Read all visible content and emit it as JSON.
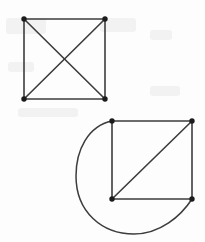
{
  "figure": {
    "background_color": "#fdfdfd",
    "edge_color": "#3c3c3c",
    "vertex_color": "#1c1c1c",
    "width": 205,
    "height": 242
  },
  "graphs": [
    {
      "id": "top-graph",
      "name": "complete-graph-k4",
      "description": "Square with both diagonals drawn (K4)",
      "vertices": [
        {
          "name": "top-left",
          "x": 24,
          "y": 19
        },
        {
          "name": "top-right",
          "x": 105,
          "y": 19
        },
        {
          "name": "bottom-left",
          "x": 24,
          "y": 99
        },
        {
          "name": "bottom-right",
          "x": 105,
          "y": 99
        }
      ],
      "edges": [
        {
          "name": "top-side",
          "type": "line",
          "x1": 24,
          "y1": 19,
          "x2": 105,
          "y2": 19
        },
        {
          "name": "right-side",
          "type": "line",
          "x1": 105,
          "y1": 19,
          "x2": 105,
          "y2": 99
        },
        {
          "name": "bottom-side",
          "type": "line",
          "x1": 24,
          "y1": 99,
          "x2": 105,
          "y2": 99
        },
        {
          "name": "left-side",
          "type": "line",
          "x1": 24,
          "y1": 19,
          "x2": 24,
          "y2": 99
        },
        {
          "name": "diagonal-tl-br",
          "type": "line",
          "x1": 24,
          "y1": 19,
          "x2": 105,
          "y2": 99
        },
        {
          "name": "diagonal-tr-bl",
          "type": "line",
          "x1": 105,
          "y1": 19,
          "x2": 24,
          "y2": 99
        }
      ],
      "vertex_count": 4,
      "edge_count": 6
    },
    {
      "id": "bottom-graph",
      "name": "square-with-diagonal-and-loop-edge",
      "description": "Square with one diagonal plus a long curved edge sweeping left and below",
      "vertices": [
        {
          "name": "top-left",
          "x": 112,
          "y": 121
        },
        {
          "name": "top-right",
          "x": 192,
          "y": 121
        },
        {
          "name": "bottom-left",
          "x": 112,
          "y": 199
        },
        {
          "name": "bottom-right",
          "x": 192,
          "y": 199
        }
      ],
      "edges": [
        {
          "name": "top-side",
          "type": "line",
          "x1": 112,
          "y1": 121,
          "x2": 192,
          "y2": 121
        },
        {
          "name": "right-side",
          "type": "line",
          "x1": 192,
          "y1": 121,
          "x2": 192,
          "y2": 199
        },
        {
          "name": "bottom-side",
          "type": "line",
          "x1": 112,
          "y1": 199,
          "x2": 192,
          "y2": 199
        },
        {
          "name": "left-side",
          "type": "line",
          "x1": 112,
          "y1": 121,
          "x2": 112,
          "y2": 199
        },
        {
          "name": "diagonal-bl-tr",
          "type": "line",
          "x1": 112,
          "y1": 199,
          "x2": 192,
          "y2": 121
        },
        {
          "name": "curved-edge-tl-br",
          "type": "curve",
          "path": "M 112 121 C 88 126 76 150 76 176 C 76 212 102 234 134 234 C 160 234 181 216 192 199"
        }
      ],
      "vertex_count": 4,
      "edge_count": 6
    }
  ],
  "artifacts": [
    {
      "name": "scan-smudge-1",
      "x": 6,
      "y": 18,
      "w": 40,
      "h": 16
    },
    {
      "name": "scan-smudge-2",
      "x": 100,
      "y": 18,
      "w": 36,
      "h": 14
    },
    {
      "name": "scan-smudge-3",
      "x": 150,
      "y": 30,
      "w": 22,
      "h": 10
    },
    {
      "name": "scan-smudge-4",
      "x": 8,
      "y": 62,
      "w": 26,
      "h": 10
    },
    {
      "name": "scan-smudge-5",
      "x": 150,
      "y": 86,
      "w": 30,
      "h": 10
    },
    {
      "name": "scan-smudge-6",
      "x": 18,
      "y": 108,
      "w": 60,
      "h": 9
    }
  ]
}
